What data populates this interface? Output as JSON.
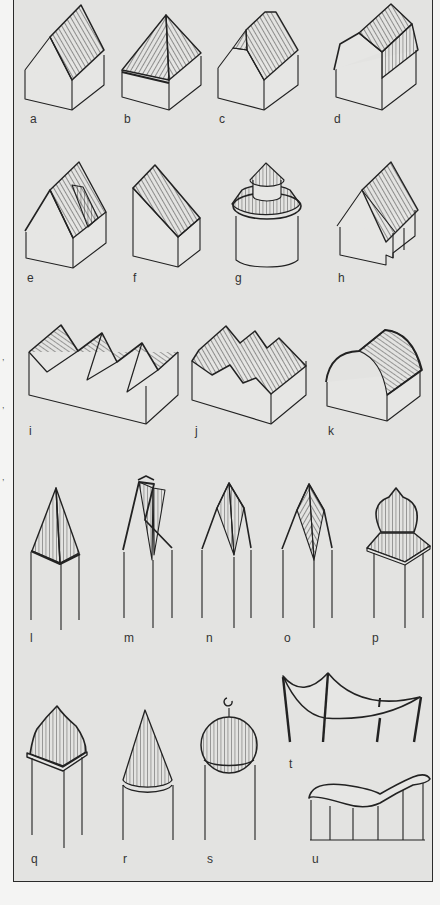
{
  "figure": {
    "type": "roof-forms-illustration",
    "colors": {
      "frame_background": "#e3e3e1",
      "page_background": "#f4f4f3",
      "ink": "#222222",
      "label": "#333333"
    },
    "panels": [
      {
        "id": "a",
        "label": "a",
        "form": "gable roof"
      },
      {
        "id": "b",
        "label": "b",
        "form": "hipped roof"
      },
      {
        "id": "c",
        "label": "c",
        "form": "half-hipped roof"
      },
      {
        "id": "d",
        "label": "d",
        "form": "gambrel / mansard roof"
      },
      {
        "id": "e",
        "label": "e",
        "form": "gable roof with dormer"
      },
      {
        "id": "f",
        "label": "f",
        "form": "lean-to (shed) roof"
      },
      {
        "id": "g",
        "label": "g",
        "form": "conical tiered roof on round tower"
      },
      {
        "id": "h",
        "label": "h",
        "form": "cross gable roof"
      },
      {
        "id": "i",
        "label": "i",
        "form": "sawtooth roof"
      },
      {
        "id": "j",
        "label": "j",
        "form": "multi-ridge (M) roof"
      },
      {
        "id": "k",
        "label": "k",
        "form": "barrel vault roof"
      },
      {
        "id": "l",
        "label": "l",
        "form": "pyramid spire"
      },
      {
        "id": "m",
        "label": "m",
        "form": "gabled spire"
      },
      {
        "id": "n",
        "label": "n",
        "form": "rhomboid spire"
      },
      {
        "id": "o",
        "label": "o",
        "form": "helm spire"
      },
      {
        "id": "p",
        "label": "p",
        "form": "onion dome on square base"
      },
      {
        "id": "q",
        "label": "q",
        "form": "ogee dome"
      },
      {
        "id": "r",
        "label": "r",
        "form": "conical spire"
      },
      {
        "id": "s",
        "label": "s",
        "form": "domed roof with crescent"
      },
      {
        "id": "t",
        "label": "t",
        "form": "tent / tensile roof"
      },
      {
        "id": "u",
        "label": "u",
        "form": "undulating (wave) roof"
      }
    ],
    "margin_marks": [
      ",",
      ",",
      ","
    ]
  }
}
